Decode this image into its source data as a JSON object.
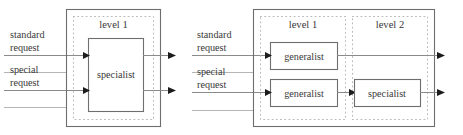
{
  "figure": {
    "colors": {
      "outer_border": "#6e6e6e",
      "region_border": "#b9b9b9",
      "node_border": "#6e6e6e",
      "flow_line": "#8a8a8a",
      "arrow_head": "#1c1c1c",
      "text": "#3a3a3a",
      "background": "#ffffff"
    }
  },
  "diagrams": [
    {
      "id": "single-level",
      "inputs": [
        {
          "line1": "standard",
          "line2": "request"
        },
        {
          "line1": "special",
          "line2": "request"
        }
      ],
      "levels": [
        {
          "label": "level 1"
        }
      ],
      "nodes": [
        {
          "label": "specialist"
        }
      ]
    },
    {
      "id": "two-level",
      "inputs": [
        {
          "line1": "standard",
          "line2": "request"
        },
        {
          "line1": "special",
          "line2": "request"
        }
      ],
      "levels": [
        {
          "label": "level 1"
        },
        {
          "label": "level 2"
        }
      ],
      "nodes": [
        {
          "label": "generalist"
        },
        {
          "label": "generalist"
        },
        {
          "label": "specialist"
        }
      ]
    }
  ]
}
